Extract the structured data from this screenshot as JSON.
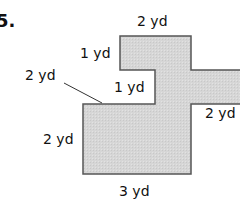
{
  "problem": {
    "number": "5.",
    "shape_fill": "#d9d9d9",
    "shape_stroke": "#555555"
  },
  "labels": {
    "top": "2 yd",
    "upper_left_vertical": "1 yd",
    "inner_horizontal": "1 yd",
    "leader_label": "2 yd",
    "right_arm": "2 yd",
    "left_vertical": "2 yd",
    "bottom": "3 yd"
  }
}
